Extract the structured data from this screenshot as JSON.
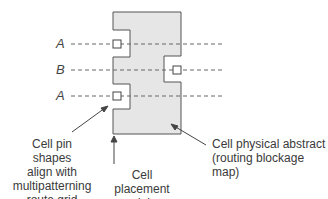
{
  "diagram": {
    "type": "cell-layout",
    "track_labels": [
      "A",
      "B",
      "A"
    ],
    "annotations": {
      "pin_shapes": "Cell pin shapes align with multipatterning route grid",
      "pin_shapes_lines": [
        "Cell pin shapes",
        "align with",
        "multipatterning",
        "route grid"
      ],
      "placement_origin_lines": [
        "Cell placement",
        "origin"
      ],
      "physical_abstract_lines": [
        "Cell physical abstract",
        "(routing blockage map)"
      ]
    },
    "colors": {
      "cell_fill": "#e6e6e6",
      "cell_stroke": "#555555",
      "track_line": "#666666",
      "arrow": "#444444"
    }
  }
}
